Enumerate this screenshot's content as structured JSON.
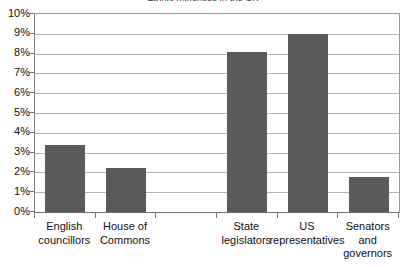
{
  "chart_data": {
    "type": "bar",
    "title": "Ethnic minorities in the UK",
    "title_note": "clipped by top edge of screenshot",
    "xlabel": "",
    "ylabel": "",
    "ylim": [
      0,
      10
    ],
    "ytick_step": 1,
    "ytick_labels": [
      "0%",
      "1%",
      "2%",
      "3%",
      "4%",
      "5%",
      "6%",
      "7%",
      "8%",
      "9%",
      "10%"
    ],
    "ytick_values": [
      0,
      1,
      2,
      3,
      4,
      5,
      6,
      7,
      8,
      9,
      10
    ],
    "grid": true,
    "legend": "none",
    "value_suffix": "%",
    "categories": [
      "English councillors",
      "House of Commons",
      "",
      "State legislators",
      "US representatives",
      "Senators and governors"
    ],
    "values": [
      3.4,
      2.2,
      null,
      8.1,
      9.0,
      1.75
    ],
    "bars": [
      {
        "label": "English councillors",
        "label_lines": [
          "English",
          "councillors"
        ],
        "value": 3.4
      },
      {
        "label": "House of Commons",
        "label_lines": [
          "House of",
          "Commons"
        ],
        "value": 2.2
      },
      {
        "label": "",
        "label_lines": [],
        "value": null
      },
      {
        "label": "State legislators",
        "label_lines": [
          "State",
          "legislators"
        ],
        "value": 8.1
      },
      {
        "label": "US representatives",
        "label_lines": [
          "US",
          "representatives"
        ],
        "value": 9.0
      },
      {
        "label": "Senators and governors",
        "label_lines": [
          "Senators",
          "and",
          "governors"
        ],
        "value": 1.75
      }
    ]
  },
  "colors": {
    "bar_fill": "#5a5a5a",
    "gridline": "#b4b4b4",
    "axis_border": "#7d7d7d",
    "tick": "#777777",
    "text": "#111111",
    "background": "#ffffff"
  }
}
